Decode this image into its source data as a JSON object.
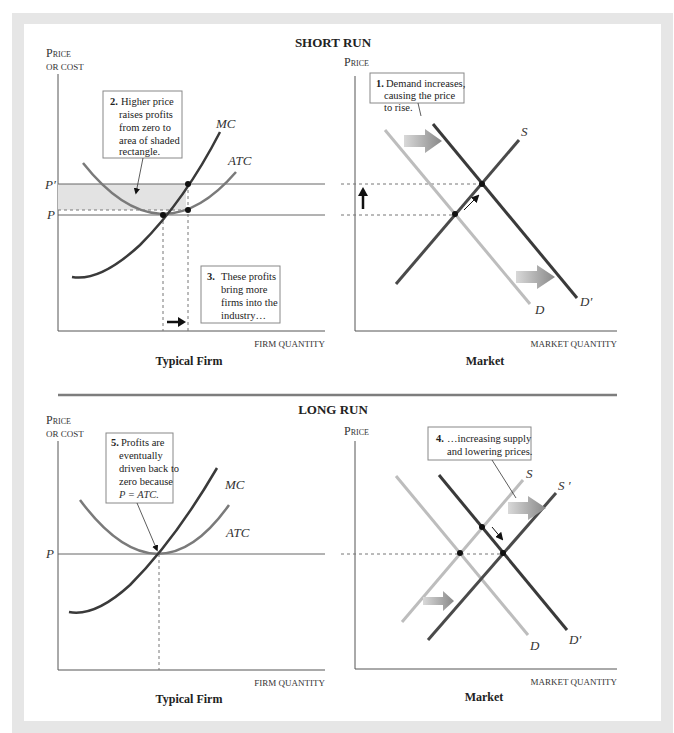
{
  "short_run": {
    "title": "SHORT RUN",
    "firm": {
      "y_label_1": "Price",
      "y_label_2": "or cost",
      "x_label": "Firm quantity",
      "caption": "Typical Firm",
      "price_labels": {
        "p_prime": "P′",
        "p": "P"
      },
      "curves": {
        "mc": "MC",
        "atc": "ATC"
      },
      "note2": {
        "num": "2.",
        "lines": [
          "Higher price",
          "raises profits",
          "from zero to",
          "area of shaded",
          "rectangle."
        ]
      },
      "note3": {
        "num": "3.",
        "lines": [
          "These profits",
          "bring more",
          "firms into the",
          "industry…"
        ]
      }
    },
    "market": {
      "y_label": "Price",
      "x_label": "Market quantity",
      "caption": "Market",
      "curves": {
        "s": "S",
        "d": "D",
        "d_prime": "D′"
      },
      "note1": {
        "num": "1.",
        "lines": [
          "Demand increases,",
          "causing the price",
          "to rise."
        ]
      }
    }
  },
  "long_run": {
    "title": "LONG RUN",
    "firm": {
      "y_label_1": "Price",
      "y_label_2": "or cost",
      "x_label": "Firm quantity",
      "caption": "Typical Firm",
      "price_labels": {
        "p": "P"
      },
      "curves": {
        "mc": "MC",
        "atc": "ATC"
      },
      "note5": {
        "num": "5.",
        "lines": [
          "Profits are",
          "eventually",
          "driven back to",
          "zero because",
          "P = ATC."
        ]
      }
    },
    "market": {
      "y_label": "Price",
      "x_label": "Market quantity",
      "caption": "Market",
      "curves": {
        "s": "S",
        "s_prime": "S ′",
        "d": "D",
        "d_prime": "D′"
      },
      "note4": {
        "num": "4.",
        "lines": [
          "…increasing supply",
          "and lowering prices."
        ]
      }
    }
  },
  "colors": {
    "frame": "#e6e6e6",
    "axis": "#555555",
    "dark_curve": "#3a3a3a",
    "mid_curve": "#7a7a7a",
    "light_curve": "#bdbdbd",
    "shaded_rect": "#e3e3e3",
    "divider": "#7d7d7d"
  }
}
